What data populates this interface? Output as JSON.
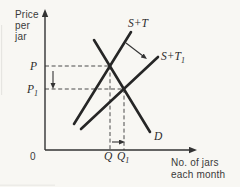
{
  "figure": {
    "colors": {
      "background": "#f8f7f3",
      "curve": "#262626",
      "axis": "#333333",
      "dashed": "#4a4a4a",
      "text": "#3a3a3a"
    },
    "y_axis_title": [
      "Price",
      "per",
      "jar"
    ],
    "x_axis_title": [
      "No. of jars",
      "each month"
    ],
    "origin_label": "0",
    "labels": {
      "p": {
        "main": "P",
        "sub": ""
      },
      "p1": {
        "main": "P",
        "sub": "1"
      },
      "q": {
        "main": "Q",
        "sub": ""
      },
      "q1": {
        "main": "Q",
        "sub": "1"
      },
      "supply_tax": {
        "main": "S+T",
        "sub": ""
      },
      "supply_tax1": {
        "main": "S+T",
        "sub": "1"
      },
      "demand": {
        "main": "D",
        "sub": ""
      }
    },
    "geometry": {
      "axes": {
        "y": {
          "x1": 45,
          "y1": 150,
          "x2": 45,
          "y2": 16
        },
        "x": {
          "x1": 45,
          "y1": 150,
          "x2": 190,
          "y2": 150
        }
      },
      "curves": {
        "supply_tax": {
          "x1": 74,
          "y1": 124,
          "x2": 131,
          "y2": 32
        },
        "supply_tax1": {
          "x1": 81,
          "y1": 129,
          "x2": 158,
          "y2": 57
        },
        "demand": {
          "x1": 94,
          "y1": 40,
          "x2": 150,
          "y2": 132
        }
      },
      "dashed": {
        "p_horizontal": {
          "x1": 45,
          "y1": 66,
          "x2": 110,
          "y2": 66
        },
        "p1_horizontal": {
          "x1": 45,
          "y1": 89,
          "x2": 124,
          "y2": 89
        },
        "q_vertical": {
          "x1": 110,
          "y1": 66,
          "x2": 110,
          "y2": 150
        },
        "q1_vertical": {
          "x1": 124,
          "y1": 89,
          "x2": 124,
          "y2": 150
        }
      },
      "arrows": {
        "price_fall": {
          "x1": 53,
          "y1": 71,
          "x2": 53,
          "y2": 84
        },
        "quantity_rise": {
          "x1": 112,
          "y1": 142,
          "x2": 120,
          "y2": 142
        },
        "supply_shift": {
          "x1": 126,
          "y1": 43,
          "x2": 143,
          "y2": 56
        }
      },
      "intersections": {
        "initial_equilibrium": {
          "x": 110,
          "y": 66
        },
        "new_equilibrium": {
          "x": 124,
          "y": 89
        }
      }
    }
  }
}
